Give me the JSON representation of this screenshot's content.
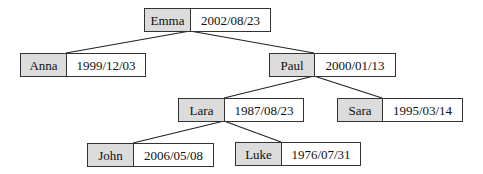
{
  "diagram": {
    "type": "tree",
    "nodes": [
      {
        "id": "emma",
        "name": "Emma",
        "date": "2002/08/23"
      },
      {
        "id": "anna",
        "name": "Anna",
        "date": "1999/12/03"
      },
      {
        "id": "paul",
        "name": "Paul",
        "date": "2000/01/13"
      },
      {
        "id": "lara",
        "name": "Lara",
        "date": "1987/08/23"
      },
      {
        "id": "sara",
        "name": "Sara",
        "date": "1995/03/14"
      },
      {
        "id": "john",
        "name": "John",
        "date": "2006/05/08"
      },
      {
        "id": "luke",
        "name": "Luke",
        "date": "1976/07/31"
      }
    ],
    "edges": [
      {
        "from": "emma",
        "to": "anna"
      },
      {
        "from": "emma",
        "to": "paul"
      },
      {
        "from": "paul",
        "to": "lara"
      },
      {
        "from": "paul",
        "to": "sara"
      },
      {
        "from": "lara",
        "to": "john"
      },
      {
        "from": "lara",
        "to": "luke"
      }
    ]
  }
}
